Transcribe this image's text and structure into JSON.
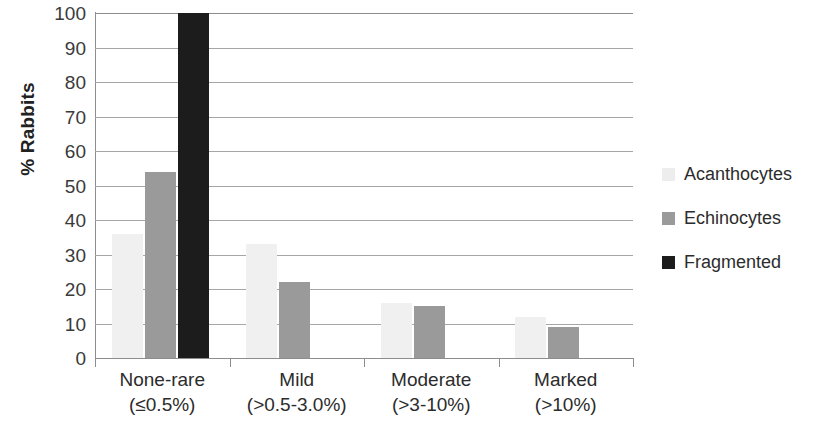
{
  "chart_data": {
    "type": "bar",
    "title": "",
    "subtitle": "",
    "xlabel": "",
    "ylabel": "% Rabbits",
    "ylim": [
      0,
      100
    ],
    "yticks": [
      100,
      90,
      80,
      70,
      60,
      50,
      40,
      30,
      20,
      10,
      0
    ],
    "grid": true,
    "legend_position": "right",
    "categories": [
      {
        "name": "None-rare",
        "range": "(≤0.5%)"
      },
      {
        "name": "Mild",
        "range": "(>0.5-3.0%)"
      },
      {
        "name": "Moderate",
        "range": "(>3-10%)"
      },
      {
        "name": "Marked",
        "range": "(>10%)"
      }
    ],
    "series": [
      {
        "name": "Acanthocytes",
        "color": "#ededed",
        "values": [
          36,
          33,
          16,
          12
        ]
      },
      {
        "name": "Echinocytes",
        "color": "#9a9a9a",
        "values": [
          54,
          22,
          15,
          9
        ]
      },
      {
        "name": "Fragmented",
        "color": "#1c1c1c",
        "values": [
          100,
          0,
          0,
          0
        ]
      }
    ]
  },
  "legend": {
    "items": [
      {
        "label": "Acanthocytes",
        "swatch": "series-acanthocytes"
      },
      {
        "label": "Echinocytes",
        "swatch": "series-echinocytes"
      },
      {
        "label": "Fragmented",
        "swatch": "series-fragmented"
      }
    ]
  },
  "axis": {
    "y_title": "% Rabbits"
  }
}
